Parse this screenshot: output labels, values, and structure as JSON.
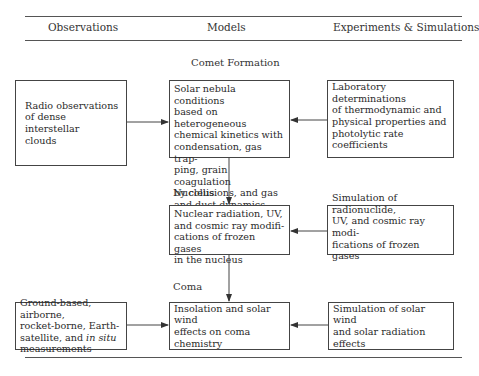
{
  "columns": {
    "observations": "Observations",
    "models": "Models",
    "experiments": "Experiments & Simulations"
  },
  "stages": {
    "comet_formation": {
      "label": "Comet Formation",
      "observation": "Radio observations\nof dense interstellar\nclouds",
      "model": "Solar nebula conditions\nbased on heterogeneous\nchemical kinetics with\ncondensation, gas trap-\nping, grain coagulation\nby collisions, and gas\nand dust dynamics",
      "experiment": "Laboratory determinations\nof thermodynamic and\nphysical properties and\nphotolytic rate coefficients"
    },
    "nucleus": {
      "label": "Nucleus",
      "model": "Nuclear radiation, UV,\nand cosmic ray modifi-\ncations of frozen gases\nin the nucleus",
      "experiment": "Simulation of radionuclide,\nUV, and cosmic ray modi-\nfications of frozen gases"
    },
    "coma": {
      "label": "Coma",
      "observation_pre": "Ground-based, airborne,\nrocket-borne, Earth-\nsatellite, and ",
      "observation_italic": "in situ",
      "observation_post": "\nmeasurements",
      "model": "Insolation and solar wind\neffects on coma chemistry",
      "experiment": "Simulation of solar wind\nand solar radiation effects"
    }
  },
  "colors": {
    "line": "#444444",
    "text": "#2a2a2a",
    "background": "#ffffff"
  }
}
